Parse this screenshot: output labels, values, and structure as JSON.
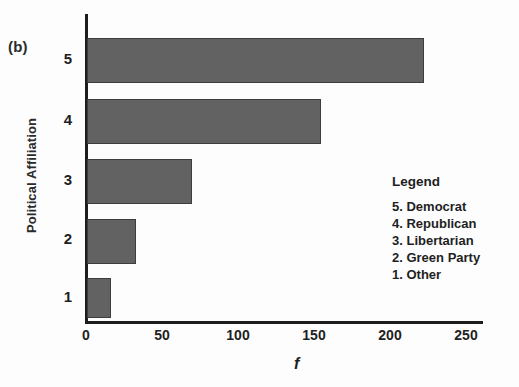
{
  "panel_label": "(b)",
  "legend": {
    "title": "Legend",
    "items": [
      "5. Democrat",
      "4. Republican",
      "3. Libertarian",
      "2. Green Party",
      "1. Other"
    ]
  },
  "chart_data": {
    "type": "bar",
    "orientation": "horizontal",
    "title": "",
    "xlabel": "f",
    "ylabel": "Political Affiliation",
    "categories": [
      "1",
      "2",
      "3",
      "4",
      "5"
    ],
    "values": [
      16,
      32,
      69,
      154,
      222
    ],
    "category_names": [
      "Other",
      "Green Party",
      "Libertarian",
      "Republican",
      "Democrat"
    ],
    "xlim": [
      0,
      262
    ],
    "xticks": [
      0,
      50,
      100,
      150,
      200,
      250
    ],
    "xtick_labels": [
      "0",
      "50",
      "100",
      "150",
      "200",
      "250"
    ],
    "ytick_labels": [
      "5",
      "4",
      "3",
      "2",
      "1"
    ],
    "grid": false,
    "legend_position": "inside-right",
    "bar_color": "#626262",
    "bar_edge_color": "#3d3d3d",
    "axis_color": "#1d1d1d",
    "background": "#fdfdfd"
  }
}
